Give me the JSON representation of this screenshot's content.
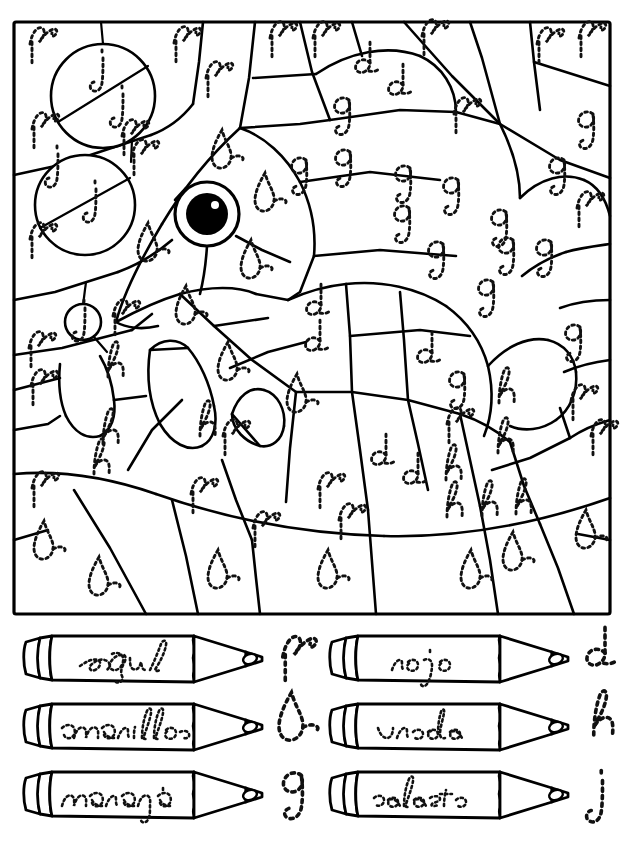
{
  "worksheet": {
    "type": "color-by-letter",
    "language": "es",
    "subject": "fish",
    "title": ""
  },
  "picture": {
    "name": "fish-color-by-letter-picture",
    "frame": {
      "x": 14,
      "y": 22,
      "width": 596,
      "height": 592
    },
    "eye": {
      "cx": 207,
      "cy": 214,
      "white_r": 32,
      "pupil_r": 21,
      "glint_r": 4
    },
    "bubbles": [
      {
        "cx": 103,
        "cy": 96,
        "r": 52,
        "letter": "j",
        "count": 2
      },
      {
        "cx": 85,
        "cy": 205,
        "r": 50,
        "letter": "j",
        "count": 2
      },
      {
        "cx": 83,
        "cy": 323,
        "r": 18,
        "letter": "j",
        "count": 1
      }
    ],
    "letter_counts": {
      "p": 30,
      "b": 18,
      "g": 17,
      "d": 10,
      "h": 12,
      "j": 5
    },
    "letters": [
      {
        "l": "p",
        "x": 39,
        "y": 48
      },
      {
        "l": "j",
        "x": 101,
        "y": 72
      },
      {
        "l": "p",
        "x": 183,
        "y": 47
      },
      {
        "l": "p",
        "x": 215,
        "y": 82
      },
      {
        "l": "p",
        "x": 279,
        "y": 42
      },
      {
        "l": "p",
        "x": 322,
        "y": 42
      },
      {
        "l": "d",
        "x": 366,
        "y": 70
      },
      {
        "l": "p",
        "x": 431,
        "y": 40
      },
      {
        "l": "p",
        "x": 546,
        "y": 48
      },
      {
        "l": "p",
        "x": 588,
        "y": 42
      },
      {
        "l": "j",
        "x": 121,
        "y": 108
      },
      {
        "l": "d",
        "x": 399,
        "y": 92
      },
      {
        "l": "p",
        "x": 463,
        "y": 118
      },
      {
        "l": "p",
        "x": 41,
        "y": 133
      },
      {
        "l": "p",
        "x": 131,
        "y": 140
      },
      {
        "l": "g",
        "x": 343,
        "y": 118
      },
      {
        "l": "g",
        "x": 587,
        "y": 132
      },
      {
        "l": "b",
        "x": 224,
        "y": 160
      },
      {
        "l": "j",
        "x": 56,
        "y": 168
      },
      {
        "l": "p",
        "x": 141,
        "y": 160
      },
      {
        "l": "g",
        "x": 300,
        "y": 178
      },
      {
        "l": "g",
        "x": 344,
        "y": 170
      },
      {
        "l": "g",
        "x": 404,
        "y": 186
      },
      {
        "l": "g",
        "x": 452,
        "y": 198
      },
      {
        "l": "g",
        "x": 558,
        "y": 178
      },
      {
        "l": "j",
        "x": 94,
        "y": 203
      },
      {
        "l": "b",
        "x": 267,
        "y": 203
      },
      {
        "l": "p",
        "x": 586,
        "y": 212
      },
      {
        "l": "g",
        "x": 403,
        "y": 226
      },
      {
        "l": "g",
        "x": 500,
        "y": 230
      },
      {
        "l": "p",
        "x": 39,
        "y": 243
      },
      {
        "l": "b",
        "x": 150,
        "y": 253
      },
      {
        "l": "b",
        "x": 253,
        "y": 270
      },
      {
        "l": "g",
        "x": 437,
        "y": 262
      },
      {
        "l": "g",
        "x": 507,
        "y": 258
      },
      {
        "l": "g",
        "x": 545,
        "y": 260
      },
      {
        "l": "d",
        "x": 317,
        "y": 312
      },
      {
        "l": "g",
        "x": 487,
        "y": 300
      },
      {
        "l": "j",
        "x": 83,
        "y": 322
      },
      {
        "l": "p",
        "x": 122,
        "y": 320
      },
      {
        "l": "b",
        "x": 188,
        "y": 316
      },
      {
        "l": "d",
        "x": 316,
        "y": 348
      },
      {
        "l": "g",
        "x": 574,
        "y": 345
      },
      {
        "l": "p",
        "x": 38,
        "y": 352
      },
      {
        "l": "h",
        "x": 113,
        "y": 373
      },
      {
        "l": "b",
        "x": 230,
        "y": 372
      },
      {
        "l": "d",
        "x": 428,
        "y": 360
      },
      {
        "l": "p",
        "x": 40,
        "y": 390
      },
      {
        "l": "g",
        "x": 458,
        "y": 392
      },
      {
        "l": "b",
        "x": 299,
        "y": 404
      },
      {
        "l": "h",
        "x": 504,
        "y": 399
      },
      {
        "l": "p",
        "x": 456,
        "y": 428
      },
      {
        "l": "p",
        "x": 580,
        "y": 405
      },
      {
        "l": "h",
        "x": 108,
        "y": 440
      },
      {
        "l": "h",
        "x": 205,
        "y": 432
      },
      {
        "l": "p",
        "x": 232,
        "y": 440
      },
      {
        "l": "h",
        "x": 503,
        "y": 449
      },
      {
        "l": "p",
        "x": 600,
        "y": 440
      },
      {
        "l": "d",
        "x": 382,
        "y": 462
      },
      {
        "l": "p",
        "x": 41,
        "y": 492
      },
      {
        "l": "h",
        "x": 99,
        "y": 470
      },
      {
        "l": "p",
        "x": 200,
        "y": 498
      },
      {
        "l": "p",
        "x": 327,
        "y": 493
      },
      {
        "l": "d",
        "x": 414,
        "y": 481
      },
      {
        "l": "h",
        "x": 452,
        "y": 513
      },
      {
        "l": "h",
        "x": 487,
        "y": 512
      },
      {
        "l": "h",
        "x": 521,
        "y": 510
      },
      {
        "l": "p",
        "x": 262,
        "y": 532
      },
      {
        "l": "p",
        "x": 348,
        "y": 524
      },
      {
        "l": "h",
        "x": 451,
        "y": 476
      },
      {
        "l": "b",
        "x": 46,
        "y": 551
      },
      {
        "l": "b",
        "x": 588,
        "y": 540
      },
      {
        "l": "b",
        "x": 101,
        "y": 587
      },
      {
        "l": "b",
        "x": 220,
        "y": 580
      },
      {
        "l": "b",
        "x": 330,
        "y": 580
      },
      {
        "l": "b",
        "x": 473,
        "y": 580
      },
      {
        "l": "b",
        "x": 515,
        "y": 562
      }
    ]
  },
  "legend": {
    "name": "color-key-legend",
    "columns": 2,
    "rows": 3,
    "items": [
      {
        "id": "azul",
        "color_name": "azul",
        "letter": "p",
        "hex": "#1f54c8",
        "column": "left",
        "row": 1
      },
      {
        "id": "amarillo",
        "color_name": "amarillo",
        "letter": "b",
        "hex": "#f2d200",
        "column": "left",
        "row": 2
      },
      {
        "id": "naranja",
        "color_name": "naranja",
        "letter": "g",
        "hex": "#f07a12",
        "column": "left",
        "row": 3
      },
      {
        "id": "rojo",
        "color_name": "rojo",
        "letter": "d",
        "hex": "#e01b1b",
        "column": "right",
        "row": 1
      },
      {
        "id": "verde",
        "color_name": "verde",
        "letter": "h",
        "hex": "#1f9c2f",
        "column": "right",
        "row": 2
      },
      {
        "id": "celeste",
        "color_name": "celeste",
        "letter": "j",
        "hex": "#5fc8f0",
        "column": "right",
        "row": 3
      }
    ]
  }
}
